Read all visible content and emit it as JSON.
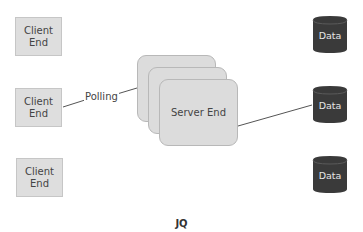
{
  "diagram": {
    "clients": [
      {
        "line1": "Client",
        "line2": "End"
      },
      {
        "line1": "Client",
        "line2": "End"
      },
      {
        "line1": "Client",
        "line2": "End"
      }
    ],
    "server": {
      "label": "Server End",
      "stack_count": 3
    },
    "edge_label": "Polling",
    "data_stores": [
      {
        "label": "Data"
      },
      {
        "label": "Data"
      },
      {
        "label": "Data"
      }
    ],
    "caption": "JQ",
    "colors": {
      "client_fill": "#dedede",
      "server_fill": "#dcdcdc",
      "data_fill": "#3a3a3a",
      "line": "#555555"
    }
  }
}
